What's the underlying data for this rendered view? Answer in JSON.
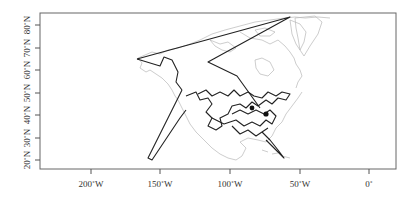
{
  "map": {
    "type": "route map",
    "region": "North America",
    "x_axis": {
      "ticks": [
        {
          "label": "200˚W",
          "x": 91
        },
        {
          "label": "150˚W",
          "x": 160
        },
        {
          "label": "100˚W",
          "x": 230
        },
        {
          "label": "50˚W",
          "x": 300
        },
        {
          "label": "0˚",
          "x": 369
        }
      ]
    },
    "y_axis": {
      "ticks": [
        {
          "label": "80˚N",
          "y": 25
        },
        {
          "label": "70˚N",
          "y": 48
        },
        {
          "label": "60˚N",
          "y": 70
        },
        {
          "label": "50˚N",
          "y": 93
        },
        {
          "label": "40˚N",
          "y": 115
        },
        {
          "label": "30˚N",
          "y": 138
        },
        {
          "label": "20˚N",
          "y": 160
        }
      ]
    },
    "colors": {
      "route": "#222222",
      "coastline": "#b8b8b8",
      "frame": "#666666"
    }
  }
}
